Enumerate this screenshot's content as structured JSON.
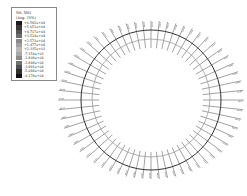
{
  "legend": {
    "title_line1": "SM, SM1",
    "title_line2": "(Avg: 75%)",
    "entries": [
      {
        "value": "+6.592e+04",
        "color": "#1a1a1a"
      },
      {
        "value": "+5.651e+04",
        "color": "#3a3a3a"
      },
      {
        "value": "+4.717e+04",
        "color": "#555555"
      },
      {
        "value": "+3.514e+04",
        "color": "#6e6e6e"
      },
      {
        "value": "+2.573e+04",
        "color": "#888888"
      },
      {
        "value": "+1.477e+04",
        "color": "#a0a0a0"
      },
      {
        "value": "+2.335e+03",
        "color": "#b8b8b8"
      },
      {
        "value": "-7.154e+03",
        "color": "#a8a8a8"
      },
      {
        "value": "-1.808e+04",
        "color": "#8c8c8c"
      },
      {
        "value": "-2.898e+04",
        "color": "#707070"
      },
      {
        "value": "-3.991e+04",
        "color": "#505050"
      },
      {
        "value": "-5.088e+04",
        "color": "#303030"
      },
      {
        "value": "-6.178e+04",
        "color": "#111111"
      }
    ]
  },
  "plot": {
    "center_x": 151,
    "center_y": 100,
    "outer_ring_radius": 70,
    "outer_ring_color": "#333333",
    "inner_ring_radius": 59,
    "inner_ring_color": "#9a9a9a",
    "tick_count": 60,
    "tick_inner_radius": 52,
    "tick_outer_radius": 86,
    "tick_color": "#444444"
  }
}
